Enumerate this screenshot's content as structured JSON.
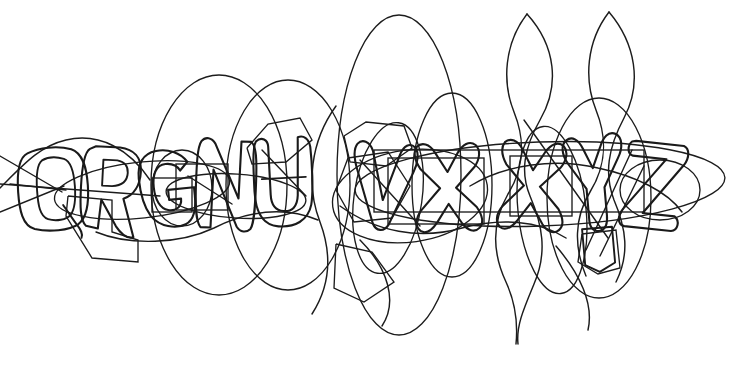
{
  "captcha": {
    "type": "image-captcha",
    "description": "Distorted hollow outline letters overlaid with random noise curves",
    "solution_text": "QRGNUVXXYZ",
    "character_count": 10,
    "characters": [
      {
        "index": 0,
        "label": "Q",
        "x": 20,
        "y": 148,
        "width": 58,
        "height": 82,
        "rotation": -4
      },
      {
        "index": 1,
        "label": "R",
        "x": 82,
        "y": 145,
        "width": 56,
        "height": 84,
        "rotation": 3
      },
      {
        "index": 2,
        "label": "G",
        "x": 140,
        "y": 150,
        "width": 54,
        "height": 78,
        "rotation": -6
      },
      {
        "index": 3,
        "label": "N",
        "x": 196,
        "y": 140,
        "width": 58,
        "height": 88,
        "rotation": 2
      },
      {
        "index": 4,
        "label": "U",
        "x": 256,
        "y": 138,
        "width": 56,
        "height": 86,
        "rotation": -3
      },
      {
        "index": 5,
        "label": "V",
        "x": 352,
        "y": 142,
        "width": 62,
        "height": 88,
        "rotation": 5
      },
      {
        "index": 6,
        "label": "X",
        "x": 416,
        "y": 144,
        "width": 62,
        "height": 84,
        "rotation": -2
      },
      {
        "index": 7,
        "label": "X",
        "x": 500,
        "y": 142,
        "width": 60,
        "height": 86,
        "rotation": 4
      },
      {
        "index": 8,
        "label": "Y",
        "x": 566,
        "y": 136,
        "width": 58,
        "height": 92,
        "rotation": -5
      },
      {
        "index": 9,
        "label": "Z",
        "x": 624,
        "y": 138,
        "width": 60,
        "height": 88,
        "rotation": 6
      }
    ],
    "colors": {
      "background": "#ffffff",
      "stroke": "#1a1a1a",
      "noise_stroke": "#1c1c1c"
    },
    "canvas": {
      "width": 741,
      "height": 378
    },
    "noise": {
      "ellipse_count": 6,
      "wave_count": 4,
      "polygon_count": 5,
      "line_count": 7
    }
  }
}
